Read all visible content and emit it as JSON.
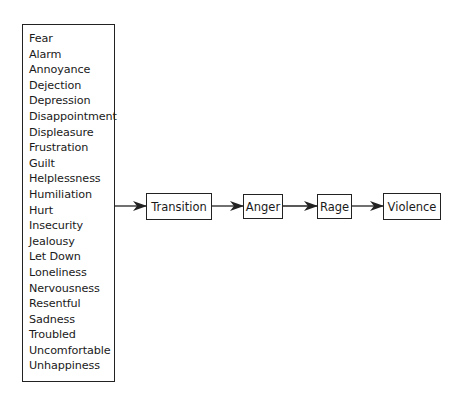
{
  "emotions_list": {
    "items": [
      "Fear",
      "Alarm",
      "Annoyance",
      "Dejection",
      "Depression",
      "Disappointment",
      "Displeasure",
      "Frustration",
      "Guilt",
      "Helplessness",
      "Humiliation",
      "Hurt",
      "Insecurity",
      "Jealousy",
      "Let Down",
      "Loneliness",
      "Nervousness",
      "Resentful",
      "Sadness",
      "Troubled",
      "Uncomfortable",
      "Unhappiness"
    ]
  },
  "flow": {
    "nodes": [
      {
        "label": "Transition"
      },
      {
        "label": "Anger"
      },
      {
        "label": "Rage"
      },
      {
        "label": "Violence"
      }
    ]
  },
  "colors": {
    "line": "#222222",
    "background": "#ffffff"
  }
}
